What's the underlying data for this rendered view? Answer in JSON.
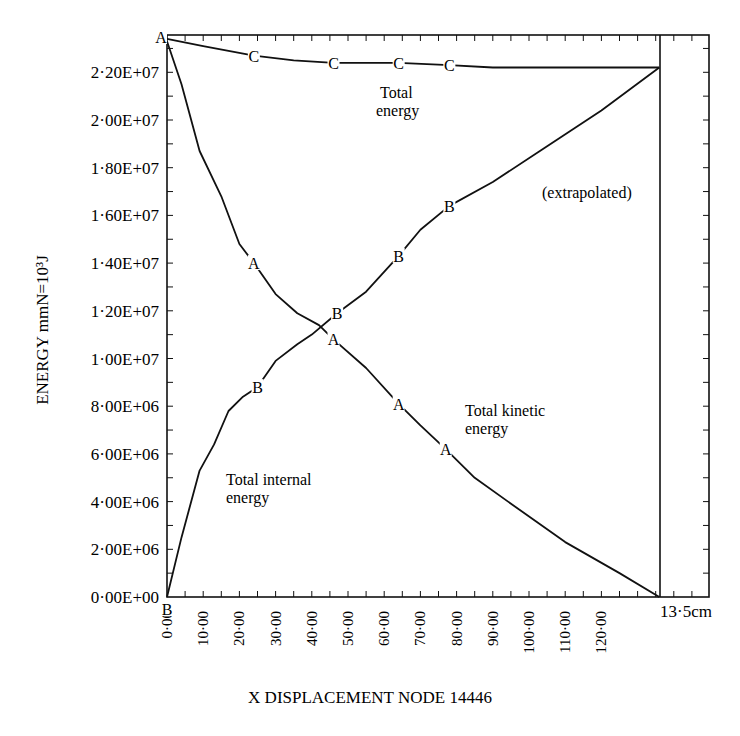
{
  "chart_data": {
    "type": "line",
    "title": "",
    "xlabel": "X DISPLACEMENT NODE 14446",
    "ylabel": "ENERGY mmN=10³J",
    "x_end_label": "13·5cm",
    "xlim": [
      0,
      136
    ],
    "ylim": [
      0,
      23500000
    ],
    "grid": false,
    "legend_position": "inline annotations",
    "x_tick_labels": [
      "0·00",
      "10·00",
      "20·00",
      "30·00",
      "40·00",
      "50·00",
      "60·00",
      "70·00",
      "80·00",
      "90·00",
      "100·00",
      "110·00",
      "120·00"
    ],
    "x_tick_values": [
      0,
      10,
      20,
      30,
      40,
      50,
      60,
      70,
      80,
      90,
      100,
      110,
      120
    ],
    "y_tick_labels": [
      "0·00E+00",
      "2·00E+06",
      "4·00E+06",
      "6·00E+06",
      "8·00E+06",
      "1·00E+07",
      "1·20E+07",
      "1·40E+07",
      "1·60E+07",
      "1·80E+07",
      "2·00E+07",
      "2·20E+07"
    ],
    "y_tick_values": [
      0,
      2000000,
      4000000,
      6000000,
      8000000,
      10000000,
      12000000,
      14000000,
      16000000,
      18000000,
      20000000,
      22000000
    ],
    "series": [
      {
        "name": "Total energy",
        "marker": "C",
        "x": [
          0,
          10,
          24,
          35,
          46,
          56,
          64,
          78,
          90,
          110,
          136
        ],
        "values": [
          23400000,
          23100000,
          22700000,
          22500000,
          22400000,
          22400000,
          22400000,
          22300000,
          22200000,
          22200000,
          22200000
        ],
        "marker_x": [
          24,
          46,
          64,
          78
        ]
      },
      {
        "name": "Total kinetic energy",
        "marker": "A",
        "x": [
          0,
          4,
          9,
          15,
          20,
          24,
          30,
          36,
          42,
          46,
          55,
          64,
          70,
          77,
          85,
          97,
          110,
          125,
          136
        ],
        "values": [
          23300000,
          21500000,
          18700000,
          16800000,
          14800000,
          14000000,
          12700000,
          11900000,
          11400000,
          10800000,
          9600000,
          8100000,
          7200000,
          6200000,
          5000000,
          3700000,
          2300000,
          1000000,
          0
        ],
        "marker_x": [
          0,
          24,
          46,
          64,
          77
        ]
      },
      {
        "name": "Total internal energy",
        "marker": "B",
        "x": [
          0,
          4,
          9,
          13,
          17,
          21,
          25,
          30,
          36,
          40,
          47,
          55,
          64,
          70,
          78,
          90,
          103,
          120,
          136
        ],
        "values": [
          0,
          2500000,
          5300000,
          6400000,
          7800000,
          8400000,
          8800000,
          9900000,
          10600000,
          11000000,
          11900000,
          12800000,
          14300000,
          15400000,
          16400000,
          17400000,
          18700000,
          20400000,
          22200000
        ],
        "marker_x": [
          0,
          25,
          47,
          64,
          78
        ]
      }
    ],
    "annotations": [
      {
        "id": "total-energy",
        "lines": [
          "Total",
          "energy"
        ]
      },
      {
        "id": "extrapolated",
        "lines": [
          "(extrapolated)"
        ]
      },
      {
        "id": "total-kinetic",
        "lines": [
          "Total kinetic",
          "energy"
        ]
      },
      {
        "id": "total-internal",
        "lines": [
          "Total internal",
          "energy"
        ]
      }
    ],
    "colors": {
      "ink": "#111111",
      "background": "#ffffff"
    }
  }
}
